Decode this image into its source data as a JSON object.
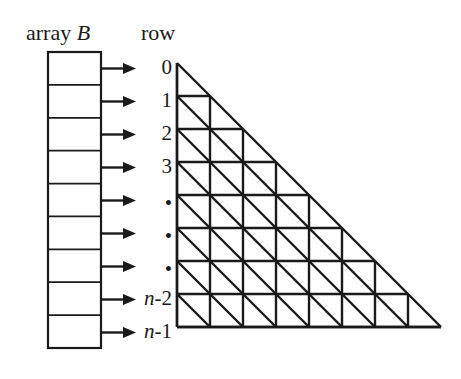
{
  "figure": {
    "type": "diagram",
    "width": 461,
    "height": 379,
    "background_color": "#ffffff",
    "line_color": "#1a1a1a"
  },
  "labels": {
    "array_title_plain": "array ",
    "array_title_italic": "B",
    "row_title": "row"
  },
  "array": {
    "name": "array-B",
    "cell_count": 9,
    "box": {
      "x": 48,
      "y": 52,
      "width": 53,
      "height": 296
    },
    "cells": [
      "",
      "",
      "",
      "",
      "",
      "",
      "",
      "",
      ""
    ]
  },
  "arrows": {
    "count": 9,
    "from_x": 101,
    "to_x": 136,
    "direction": "right"
  },
  "row_labels": [
    {
      "text": "0",
      "italic_part": "",
      "kind": "number"
    },
    {
      "text": "1",
      "italic_part": "",
      "kind": "number"
    },
    {
      "text": "2",
      "italic_part": "",
      "kind": "number"
    },
    {
      "text": "3",
      "italic_part": "",
      "kind": "number"
    },
    {
      "text": "•",
      "italic_part": "",
      "kind": "dot"
    },
    {
      "text": "•",
      "italic_part": "",
      "kind": "dot"
    },
    {
      "text": "•",
      "italic_part": "",
      "kind": "dot"
    },
    {
      "text": "-2",
      "italic_part": "n",
      "kind": "expr"
    },
    {
      "text": "-1",
      "italic_part": "n",
      "kind": "expr"
    }
  ],
  "mesh": {
    "name": "triangular-mesh",
    "rows": 8,
    "apex_x": 177,
    "apex_y": 63,
    "cell_size": 33,
    "row_cell_counts": [
      1,
      2,
      3,
      4,
      5,
      6,
      7,
      8
    ],
    "diagonal_direction": "top-left-to-bottom-right",
    "stroke_width": 2.4
  },
  "chart_data": {
    "type": "table",
    "categories": [
      "0",
      "1",
      "2",
      "3",
      "•",
      "•",
      "•",
      "n-2",
      "n-1"
    ],
    "values": [
      1,
      2,
      3,
      4,
      5,
      6,
      7,
      8,
      8
    ],
    "xlabel": "row",
    "ylabel": "cells in row"
  }
}
